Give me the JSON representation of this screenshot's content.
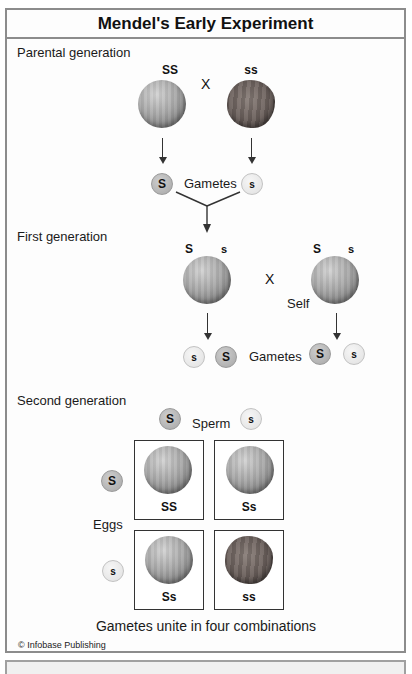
{
  "title": "Mendel's Early Experiment",
  "parental": {
    "label": "Parental generation",
    "left_genotype": "SS",
    "right_genotype": "ss",
    "cross": "X",
    "gametes_label": "Gametes",
    "gamete_left": "S",
    "gamete_right": "s"
  },
  "first": {
    "label": "First generation",
    "left": {
      "allele1": "S",
      "allele2": "s"
    },
    "right": {
      "allele1": "S",
      "allele2": "s"
    },
    "cross": "X",
    "self_label": "Self",
    "gametes_label": "Gametes",
    "gametes": [
      "s",
      "S",
      "S",
      "s"
    ]
  },
  "second": {
    "label": "Second generation",
    "sperm_label": "Sperm",
    "sperm": [
      "S",
      "s"
    ],
    "eggs_label": "Eggs",
    "eggs": [
      "S",
      "s"
    ],
    "grid": [
      {
        "genotype": "SS",
        "phenotype": "round"
      },
      {
        "genotype": "Ss",
        "phenotype": "round"
      },
      {
        "genotype": "Ss",
        "phenotype": "round"
      },
      {
        "genotype": "ss",
        "phenotype": "wrinkled"
      }
    ],
    "caption": "Gametes unite in four combinations"
  },
  "credit": "© Infobase Publishing",
  "colors": {
    "border": "#8c8c8c",
    "dominant_gamete": "#a6a6a6",
    "recessive_gamete": "#e0e0e0",
    "round_pea": "#a8a8a8",
    "wrinkled_pea": "#6b605c"
  }
}
